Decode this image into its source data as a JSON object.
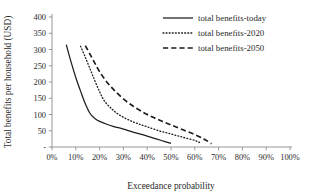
{
  "chart_data": {
    "type": "line",
    "title": "",
    "xlabel": "Exceedance probability",
    "ylabel": "Total benefits per household (USD)",
    "xlim": [
      0,
      100
    ],
    "ylim": [
      0,
      400
    ],
    "grid": false,
    "legend_position": "top-right",
    "xticklabels": [
      "0%",
      "10%",
      "20%",
      "30%",
      "40%",
      "50%",
      "60%",
      "70%",
      "80%",
      "90%",
      "100%"
    ],
    "xtickvalues": [
      0,
      10,
      20,
      30,
      40,
      50,
      60,
      70,
      80,
      90,
      100
    ],
    "yticklabels": [
      "-",
      "50",
      "100",
      "150",
      "200",
      "250",
      "300",
      "350",
      "400"
    ],
    "ytickvalues": [
      0,
      50,
      100,
      150,
      200,
      250,
      300,
      350,
      400
    ],
    "series": [
      {
        "name": "total benefits-today",
        "style": "solid",
        "color": "#1d1d1d",
        "x": [
          6,
          8,
          10,
          12,
          14,
          16,
          18,
          20,
          23,
          26,
          30,
          34,
          38,
          42,
          46,
          50
        ],
        "y": [
          315,
          262,
          214,
          172,
          133,
          103,
          88,
          79,
          70,
          63,
          55,
          46,
          38,
          29,
          20,
          11
        ]
      },
      {
        "name": "total benefits-2020",
        "style": "dotted",
        "color": "#1d1d1d",
        "x": [
          12,
          14,
          16,
          18,
          20,
          22,
          25,
          28,
          32,
          36,
          40,
          45,
          50,
          55,
          60,
          62
        ],
        "y": [
          310,
          276,
          240,
          204,
          170,
          142,
          118,
          100,
          84,
          72,
          62,
          50,
          40,
          30,
          20,
          14
        ]
      },
      {
        "name": "total benefits-2050",
        "style": "dashed",
        "color": "#1d1d1d",
        "x": [
          14,
          16,
          18,
          20,
          23,
          26,
          30,
          34,
          38,
          42,
          46,
          50,
          55,
          60,
          64,
          67
        ],
        "y": [
          312,
          285,
          258,
          232,
          200,
          176,
          148,
          126,
          108,
          93,
          80,
          68,
          53,
          38,
          24,
          10
        ]
      }
    ]
  },
  "legend": {
    "items": [
      {
        "label": "total benefits-today",
        "style": "solid"
      },
      {
        "label": "total benefits-2020",
        "style": "dotted"
      },
      {
        "label": "total benefits-2050",
        "style": "dashed"
      }
    ]
  }
}
